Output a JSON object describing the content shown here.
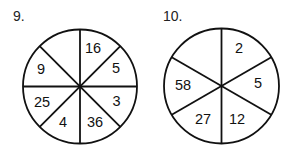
{
  "problems": [
    {
      "number": "9.",
      "segments": 8,
      "values": {
        "top_right": "16",
        "right_upper": "5",
        "right_lower": "3",
        "bottom_right": "36",
        "bottom_left": "4",
        "left_lower": "25",
        "left_upper": "9",
        "top_left": ""
      }
    },
    {
      "number": "10.",
      "segments": 6,
      "values": {
        "top_right": "2",
        "right": "5",
        "bottom_right": "12",
        "bottom_left": "27",
        "left": "58",
        "top_left": ""
      }
    }
  ],
  "colors": {
    "stroke": "#111111",
    "background": "#ffffff"
  }
}
